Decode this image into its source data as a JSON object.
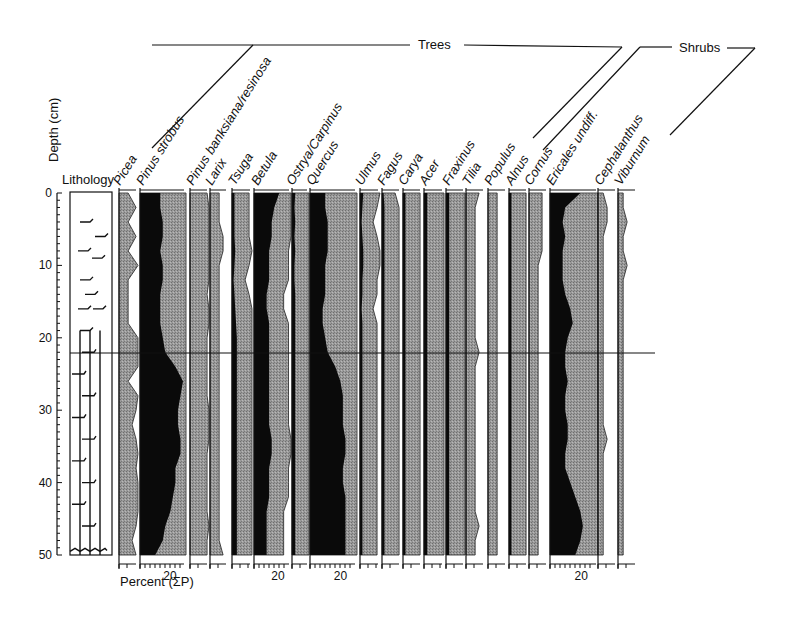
{
  "chart_data": {
    "type": "area",
    "title": "",
    "subtitle": "",
    "ylabel": "Depth (cm)",
    "xlabel": "Percent (ΣP)",
    "ylim": [
      0,
      50
    ],
    "y_ticks": [
      0,
      10,
      20,
      30,
      40,
      50
    ],
    "x_tick_label": "20",
    "groups": [
      {
        "name": "Trees",
        "taxa": [
          "Picea",
          "Pinus strobus",
          "Pinus banksiana/resinosa",
          "Larix",
          "Tsuga",
          "Betula",
          "Ostrya/Carpinus",
          "Quercus",
          "Ulmus",
          "Fagus",
          "Carya",
          "Acer",
          "Fraxinus",
          "Tilia",
          "Populus"
        ]
      },
      {
        "name": "Shrubs",
        "taxa": [
          "Alnus",
          "Cornus",
          "Ericales undiff.",
          "Cephalanthus",
          "Viburnum"
        ]
      }
    ],
    "lithology_label": "Lithology",
    "horizon_depth": 22,
    "grid": false,
    "legend_position": "none",
    "depths": [
      0,
      2,
      4,
      6,
      8,
      10,
      12,
      14,
      16,
      18,
      20,
      22,
      24,
      26,
      28,
      30,
      32,
      34,
      36,
      38,
      40,
      42,
      44,
      46,
      48,
      50
    ],
    "series": [
      {
        "name": "Picea",
        "values": [
          1,
          3,
          1,
          3,
          1,
          4,
          1,
          1,
          1,
          1,
          6,
          6,
          5,
          1,
          6,
          3,
          2,
          3,
          6,
          3,
          5,
          6,
          5,
          3,
          2,
          3
        ]
      },
      {
        "name": "Pinus strobus",
        "values": [
          8,
          8,
          9,
          9,
          8,
          9,
          9,
          8,
          8,
          8,
          9,
          10,
          14,
          17,
          16,
          15,
          15,
          16,
          16,
          14,
          14,
          13,
          12,
          10,
          9,
          6
        ]
      },
      {
        "name": "Pinus banksiana/resinosa",
        "values": [
          3,
          4,
          4,
          4,
          5,
          4,
          5,
          3,
          4,
          4,
          3,
          3,
          3,
          3,
          3,
          4,
          4,
          4,
          3,
          3,
          3,
          3,
          3,
          4,
          3,
          3
        ]
      },
      {
        "name": "Larix",
        "values": [
          1,
          1,
          1,
          2,
          2,
          1,
          1,
          1,
          1,
          1,
          1,
          1,
          1,
          1,
          1,
          1,
          1,
          1,
          1,
          1,
          1,
          1,
          1,
          1,
          1,
          2
        ]
      },
      {
        "name": "Tsuga",
        "values": [
          3,
          3,
          3,
          3,
          4,
          3,
          2,
          3,
          4,
          5,
          6,
          6,
          6,
          6,
          6,
          6,
          6,
          6,
          6,
          6,
          6,
          6,
          6,
          6,
          6,
          6
        ]
      },
      {
        "name": "Betula",
        "values": [
          10,
          8,
          7,
          7,
          6,
          6,
          6,
          5,
          5,
          6,
          6,
          6,
          6,
          6,
          6,
          6,
          6,
          7,
          7,
          6,
          6,
          6,
          5,
          5,
          5,
          5
        ]
      },
      {
        "name": "Ostrya/Carpinus",
        "values": [
          4,
          3,
          4,
          3,
          4,
          3,
          3,
          4,
          4,
          4,
          4,
          4,
          4,
          4,
          4,
          4,
          4,
          4,
          4,
          4,
          4,
          4,
          4,
          4,
          4,
          4
        ]
      },
      {
        "name": "Quercus",
        "values": [
          6,
          6,
          7,
          7,
          7,
          6,
          6,
          6,
          5,
          5,
          6,
          7,
          10,
          12,
          13,
          13,
          13,
          14,
          14,
          13,
          13,
          14,
          14,
          14,
          14,
          14
        ]
      },
      {
        "name": "Ulmus",
        "values": [
          4,
          3,
          2,
          3,
          4,
          4,
          3,
          3,
          2,
          3,
          3,
          3,
          3,
          3,
          3,
          3,
          3,
          3,
          3,
          3,
          3,
          3,
          3,
          3,
          3,
          3
        ]
      },
      {
        "name": "Fagus",
        "values": [
          2,
          3,
          3,
          3,
          3,
          3,
          3,
          3,
          3,
          3,
          3,
          3,
          3,
          3,
          3,
          3,
          3,
          3,
          3,
          3,
          3,
          3,
          3,
          3,
          3,
          3
        ]
      },
      {
        "name": "Carya",
        "values": [
          3,
          3,
          3,
          3,
          3,
          3,
          3,
          3,
          3,
          3,
          3,
          3,
          3,
          3,
          3,
          3,
          3,
          3,
          3,
          3,
          3,
          3,
          3,
          3,
          3,
          3
        ]
      },
      {
        "name": "Acer",
        "values": [
          4,
          4,
          4,
          4,
          4,
          4,
          4,
          4,
          4,
          4,
          4,
          4,
          4,
          4,
          4,
          4,
          4,
          4,
          4,
          4,
          4,
          4,
          4,
          4,
          4,
          4
        ]
      },
      {
        "name": "Fraxinus",
        "values": [
          4,
          4,
          4,
          4,
          4,
          4,
          4,
          4,
          4,
          4,
          4,
          4,
          4,
          4,
          4,
          4,
          4,
          4,
          4,
          4,
          4,
          4,
          4,
          4,
          4,
          4
        ]
      },
      {
        "name": "Tilia",
        "values": [
          2,
          1,
          1,
          1,
          1,
          1,
          1,
          1,
          1,
          1,
          1,
          2,
          1,
          1,
          1,
          1,
          1,
          1,
          1,
          1,
          1,
          1,
          1,
          2,
          1,
          1
        ]
      },
      {
        "name": "Populus",
        "values": [
          1,
          1,
          1,
          1,
          1,
          1,
          1,
          1,
          1,
          1,
          1,
          1,
          1,
          1,
          1,
          1,
          1,
          1,
          1,
          1,
          1,
          1,
          1,
          1,
          1,
          1
        ]
      },
      {
        "name": "Alnus",
        "values": [
          3,
          3,
          3,
          3,
          3,
          3,
          3,
          3,
          3,
          3,
          3,
          3,
          3,
          3,
          3,
          3,
          3,
          3,
          3,
          3,
          3,
          3,
          3,
          3,
          3,
          3
        ]
      },
      {
        "name": "Cornus",
        "values": [
          2,
          2,
          2,
          2,
          2,
          1,
          1,
          1,
          1,
          1,
          1,
          1,
          1,
          1,
          1,
          1,
          1,
          1,
          1,
          1,
          1,
          1,
          1,
          1,
          1,
          1
        ]
      },
      {
        "name": "Ericales undiff.",
        "values": [
          12,
          6,
          5,
          6,
          5,
          5,
          5,
          6,
          8,
          9,
          7,
          6,
          6,
          7,
          6,
          6,
          7,
          7,
          6,
          6,
          8,
          10,
          12,
          13,
          12,
          10
        ]
      },
      {
        "name": "Cephalanthus",
        "values": [
          0,
          1,
          1,
          0,
          0,
          0,
          0,
          0,
          0,
          0,
          0,
          0,
          0,
          0,
          0,
          0,
          0,
          1,
          0,
          0,
          0,
          0,
          0,
          0,
          0,
          0
        ]
      },
      {
        "name": "Viburnum",
        "values": [
          0,
          0,
          1,
          0,
          0,
          1,
          0,
          0,
          0,
          0,
          0,
          0,
          0,
          0,
          0,
          0,
          0,
          0,
          0,
          0,
          0,
          0,
          0,
          0,
          0,
          0
        ]
      }
    ]
  }
}
